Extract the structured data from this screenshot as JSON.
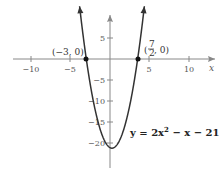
{
  "chart_data": {
    "type": "line",
    "title": "",
    "function": "y = 2x^2 - x - 21",
    "equation_label": {
      "prefix": "y = 2x",
      "exp": "2",
      "suffix": " − x − 21"
    },
    "xlabel": "x",
    "ylabel": "",
    "xlim": [
      -13,
      14
    ],
    "ylim": [
      -24,
      12.5
    ],
    "x_ticks": [
      -10,
      -5,
      5,
      10
    ],
    "x_tick_labels": [
      "−10",
      "−5",
      "5",
      "10"
    ],
    "y_ticks": [
      5,
      -5,
      -10,
      -15,
      -20
    ],
    "y_tick_labels": [
      "5",
      "−5",
      "−10",
      "−15",
      "−20"
    ],
    "grid": false,
    "legend": null,
    "series": [
      {
        "name": "y = 2x^2 - x - 21",
        "color": "#333333",
        "x": [
          -3.8,
          -3.5,
          -3,
          -2.5,
          -2,
          -1.5,
          -1,
          -0.5,
          0,
          0.25,
          0.5,
          1,
          1.5,
          2,
          2.5,
          3,
          3.5,
          4,
          4.3
        ],
        "y": [
          11.68,
          7,
          0,
          -6,
          -11,
          -15,
          -18,
          -20,
          -21,
          -21.125,
          -21,
          -20,
          -18,
          -15,
          -11,
          -6,
          0,
          7,
          11.68
        ]
      }
    ],
    "annotations": [
      {
        "label": "(−3, 0)",
        "x": -3,
        "y": 0
      },
      {
        "label": "(7/2, 0)",
        "x": 3.5,
        "y": 0
      }
    ]
  },
  "labels": {
    "point_left": "(−3, 0)",
    "point_right_num": "7",
    "point_right_den": "2",
    "point_right_tail": ", 0)",
    "point_right_open": "(",
    "x_axis": "x",
    "eq_prefix": "y = 2x",
    "eq_exp": "2",
    "eq_suffix": " − x − 21"
  },
  "colors": {
    "curve": "#333333",
    "axes": "#888888",
    "point": "#111111"
  }
}
